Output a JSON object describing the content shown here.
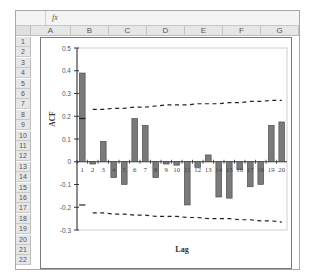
{
  "spreadsheet": {
    "namebox": "",
    "fx_label": "fx",
    "columns": [
      "A",
      "B",
      "C",
      "D",
      "E",
      "F",
      "G"
    ],
    "rows": [
      "1",
      "2",
      "3",
      "4",
      "5",
      "6",
      "7",
      "8",
      "9",
      "10",
      "11",
      "12",
      "13",
      "14",
      "15",
      "16",
      "17",
      "18",
      "19",
      "20",
      "21",
      "22"
    ]
  },
  "chart_data": {
    "type": "bar",
    "title": "",
    "xlabel": "Lag",
    "ylabel": "ACF",
    "categories": [
      "1",
      "2",
      "3",
      "4",
      "5",
      "6",
      "7",
      "8",
      "9",
      "10",
      "11",
      "12",
      "13",
      "14",
      "15",
      "16",
      "17",
      "18",
      "19",
      "20"
    ],
    "values": [
      0.39,
      -0.01,
      0.09,
      -0.07,
      -0.1,
      0.19,
      0.16,
      -0.07,
      -0.01,
      -0.015,
      -0.19,
      -0.025,
      0.03,
      -0.155,
      -0.16,
      -0.035,
      -0.11,
      -0.1,
      0.16,
      0.175
    ],
    "series": [
      {
        "name": "ACF",
        "values": [
          0.39,
          -0.01,
          0.09,
          -0.07,
          -0.1,
          0.19,
          0.16,
          -0.07,
          -0.01,
          -0.015,
          -0.19,
          -0.025,
          0.03,
          -0.155,
          -0.16,
          -0.035,
          -0.11,
          -0.1,
          0.16,
          0.175
        ]
      },
      {
        "name": "Upper confidence bound",
        "values": [
          0.19,
          0.23,
          0.23,
          0.235,
          0.235,
          0.24,
          0.24,
          0.245,
          0.25,
          0.25,
          0.25,
          0.255,
          0.255,
          0.255,
          0.26,
          0.26,
          0.265,
          0.265,
          0.27,
          0.27
        ]
      },
      {
        "name": "Lower confidence bound",
        "values": [
          -0.19,
          -0.225,
          -0.225,
          -0.23,
          -0.23,
          -0.235,
          -0.235,
          -0.24,
          -0.24,
          -0.24,
          -0.245,
          -0.245,
          -0.25,
          -0.25,
          -0.25,
          -0.255,
          -0.255,
          -0.26,
          -0.26,
          -0.265
        ]
      }
    ],
    "yticks": [
      "0.5",
      "0.4",
      "0.3",
      "0.2",
      "0.1",
      "0",
      "-0.1",
      "-0.2",
      "-0.3"
    ],
    "ylim": [
      -0.3,
      0.5
    ],
    "grid": false,
    "legend": "none",
    "colors": {
      "bar": "#7a7a7a",
      "bar_border": "#444444",
      "band": "#222222"
    }
  }
}
